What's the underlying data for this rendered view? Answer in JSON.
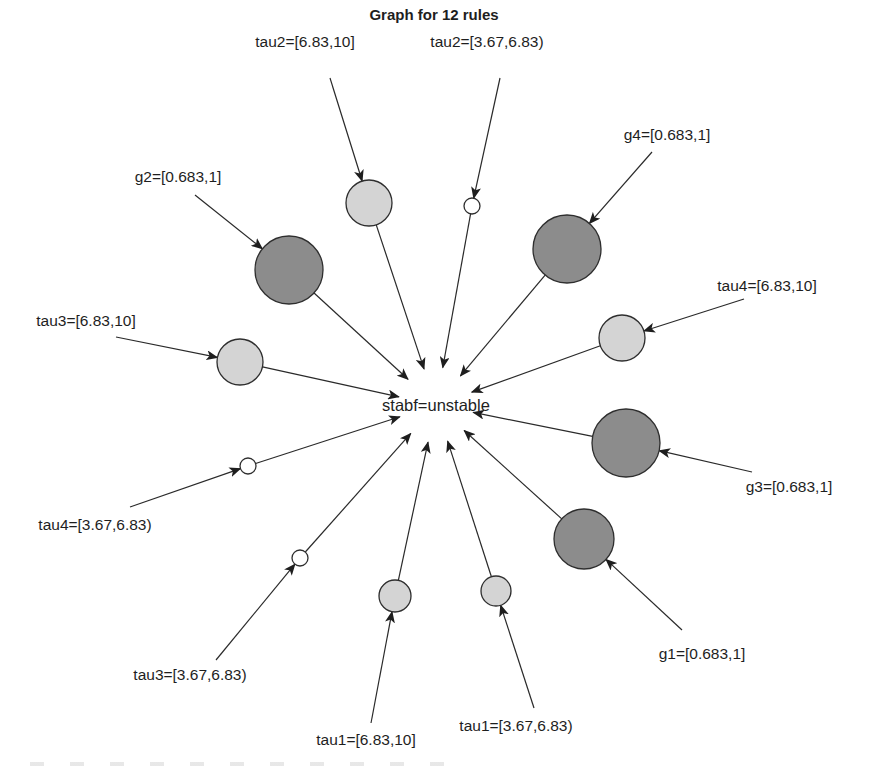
{
  "chart_data": {
    "type": "network",
    "title": "Graph for 12 rules",
    "center": {
      "label": "stabf=unstable",
      "x": 436,
      "y": 405
    },
    "colors": {
      "dark": "#8c8c8c",
      "light": "#d4d4d4",
      "white": "#ffffff",
      "edge": "#2a2a2a"
    },
    "rules": [
      {
        "label": "tau2=[6.83,10]",
        "lx": 305,
        "ly": 47,
        "sx": 330,
        "sy": 78,
        "nx": 369,
        "ny": 203,
        "r": 23,
        "shade": "light"
      },
      {
        "label": "tau2=[3.67,6.83)",
        "lx": 487,
        "ly": 47,
        "sx": 500,
        "sy": 78,
        "nx": 472,
        "ny": 206,
        "r": 8,
        "shade": "white"
      },
      {
        "label": "g4=[0.683,1]",
        "lx": 667,
        "ly": 140,
        "sx": 652,
        "sy": 152,
        "nx": 567,
        "ny": 249,
        "r": 34,
        "shade": "dark"
      },
      {
        "label": "g2=[0.683,1]",
        "lx": 178,
        "ly": 182,
        "sx": 195,
        "sy": 195,
        "nx": 289,
        "ny": 270,
        "r": 34,
        "shade": "dark"
      },
      {
        "label": "tau4=[6.83,10]",
        "lx": 767,
        "ly": 291,
        "sx": 744,
        "sy": 299,
        "nx": 622,
        "ny": 338,
        "r": 23,
        "shade": "light"
      },
      {
        "label": "tau3=[6.83,10]",
        "lx": 86,
        "ly": 326,
        "sx": 116,
        "sy": 337,
        "nx": 240,
        "ny": 362,
        "r": 23,
        "shade": "light"
      },
      {
        "label": "g3=[0.683,1]",
        "lx": 789,
        "ly": 492,
        "sx": 752,
        "sy": 472,
        "nx": 626,
        "ny": 443,
        "r": 34,
        "shade": "dark"
      },
      {
        "label": "tau4=[3.67,6.83)",
        "lx": 95,
        "ly": 530,
        "sx": 130,
        "sy": 507,
        "nx": 248,
        "ny": 466,
        "r": 8,
        "shade": "white"
      },
      {
        "label": "g1=[0.683,1]",
        "lx": 702,
        "ly": 659,
        "sx": 682,
        "sy": 630,
        "nx": 584,
        "ny": 539,
        "r": 30,
        "shade": "dark"
      },
      {
        "label": "tau3=[3.67,6.83)",
        "lx": 190,
        "ly": 680,
        "sx": 216,
        "sy": 660,
        "nx": 300,
        "ny": 558,
        "r": 8,
        "shade": "white"
      },
      {
        "label": "tau1=[6.83,10]",
        "lx": 366,
        "ly": 745,
        "sx": 371,
        "sy": 723,
        "nx": 395,
        "ny": 596,
        "r": 16,
        "shade": "light"
      },
      {
        "label": "tau1=[3.67,6.83)",
        "lx": 516,
        "ly": 731,
        "sx": 534,
        "sy": 708,
        "nx": 496,
        "ny": 591,
        "r": 15,
        "shade": "light"
      }
    ]
  }
}
